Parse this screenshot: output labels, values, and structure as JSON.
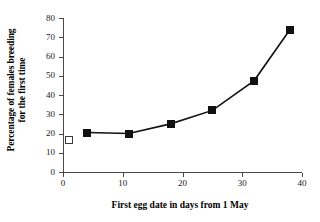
{
  "chart_data": {
    "type": "line",
    "title": "",
    "xlabel": "First egg date in days from 1 May",
    "ylabel_line1": "Percentage of females breeding",
    "ylabel_line2": "for the first time",
    "ylabel": "Percentage of females breeding for the first time",
    "xlim": [
      0,
      40
    ],
    "ylim": [
      0,
      80
    ],
    "xticks": [
      0,
      10,
      20,
      30,
      40
    ],
    "yticks": [
      0,
      10,
      20,
      30,
      40,
      50,
      60,
      70,
      80
    ],
    "xtick_labels": [
      "0",
      "10",
      "20",
      "30",
      "40"
    ],
    "ytick_labels": [
      "0",
      "10",
      "20",
      "30",
      "40",
      "50",
      "60",
      "70",
      "80"
    ],
    "grid": false,
    "legend": "none",
    "series": [
      {
        "name": "Females breeding for the first time",
        "marker": "filled-square",
        "connected": true,
        "x": [
          4,
          11,
          18,
          25,
          32,
          38
        ],
        "y": [
          20.5,
          20,
          25,
          32,
          47.5,
          74
        ]
      },
      {
        "name": "Reference point",
        "marker": "open-square",
        "connected": false,
        "x": [
          1
        ],
        "y": [
          16.5
        ]
      }
    ],
    "colors": {
      "line": "#111111",
      "filled_marker": "#111111",
      "open_marker_fill": "#ffffff",
      "open_marker_stroke": "#3a3a3a",
      "axis": "#4a4a4a",
      "text": "#000000",
      "background": "#ffffff"
    }
  }
}
